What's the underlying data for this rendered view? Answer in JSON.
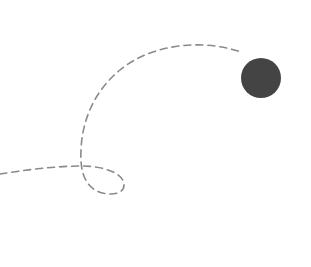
{
  "illustration": {
    "description": "Dashed looping trajectory ending at a dark ball",
    "background": "#ffffff",
    "path": {
      "color": "#8a8a8a",
      "stroke_width": 1.6,
      "dash": "7 5",
      "d": "M0,174 C25,170 55,166 83,166 C100,166 124,172 124,185 C124,196 105,196 95,190 C84,183 80,170 81,150 C82,120 95,90 120,70 C150,45 200,38 241,52"
    },
    "ball": {
      "cx": 261,
      "cy": 78,
      "r": 20,
      "color": "#444444"
    }
  }
}
